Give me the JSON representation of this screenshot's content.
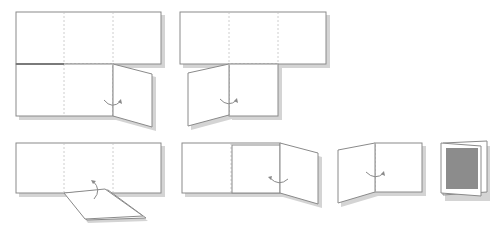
{
  "diagram": {
    "title": "",
    "colors": {
      "outline": "#8a8a8a",
      "fold_line": "#c2c2c2",
      "shadow": "#d4d4d4",
      "paper": "#ffffff",
      "cover_print": "#8c8c8c"
    },
    "steps": [
      {
        "id": 1,
        "label": "",
        "action": "fold right bottom flap inward"
      },
      {
        "id": 2,
        "label": "",
        "action": "fold left bottom flap inward"
      },
      {
        "id": 3,
        "label": "",
        "action": "fold bottom flap upward"
      },
      {
        "id": 4,
        "label": "",
        "action": "fold right panel inward"
      },
      {
        "id": 5,
        "label": "",
        "action": "fold left panel over"
      },
      {
        "id": 6,
        "label": "",
        "action": "finished booklet"
      }
    ]
  }
}
